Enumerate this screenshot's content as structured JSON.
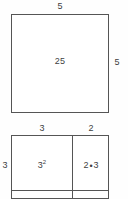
{
  "figures": [
    {
      "id": "square-area-model",
      "shape": "square",
      "top_label": "5",
      "right_label": "5",
      "area_label": "25"
    },
    {
      "id": "partitioned-rectangle-area-model",
      "shape": "rectangle-grid",
      "top_label_left": "3",
      "top_label_right": "2",
      "left_label": "3",
      "cell_top_left": {
        "base": "3",
        "exponent": "2"
      },
      "cell_top_right": {
        "left_factor": "2",
        "operator": "•",
        "right_factor": "3"
      }
    }
  ],
  "chart_data": {
    "type": "diagram",
    "title": "",
    "figures": [
      {
        "name": "square",
        "width": 5,
        "height": 5,
        "area": 25,
        "labels": {
          "top": "5",
          "right": "5",
          "interior": "25"
        }
      },
      {
        "name": "partitioned rectangle",
        "column_widths": [
          3,
          2
        ],
        "row_height": 3,
        "labels": {
          "top": [
            "3",
            "2"
          ],
          "left": "3"
        },
        "cells": [
          "3²",
          "2 • 3"
        ],
        "cell_values": [
          9,
          6
        ]
      }
    ]
  }
}
